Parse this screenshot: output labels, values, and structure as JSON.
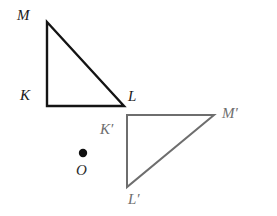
{
  "figure": {
    "background_color": "#ffffff",
    "width": 277,
    "height": 216
  },
  "shapes": {
    "preimage_triangle": {
      "name": "triangle-KML",
      "stroke_color": "#141414",
      "stroke_width": 2.4,
      "fill": "none",
      "points": "47,22 47,106 124,106",
      "vertices": [
        {
          "id": "M",
          "label": "M",
          "x": 47,
          "y": 22
        },
        {
          "id": "K",
          "label": "K",
          "x": 47,
          "y": 106
        },
        {
          "id": "L",
          "label": "L",
          "x": 124,
          "y": 106
        }
      ]
    },
    "image_triangle": {
      "name": "triangle-K-prime-L-prime-M-prime",
      "stroke_color": "#6e6e6e",
      "stroke_width": 2.0,
      "fill": "none",
      "points": "127,115 214,115 127,187",
      "vertices": [
        {
          "id": "Kp",
          "label": "K′",
          "x": 127,
          "y": 115
        },
        {
          "id": "Mp",
          "label": "M′",
          "x": 214,
          "y": 115
        },
        {
          "id": "Lp",
          "label": "L′",
          "x": 127,
          "y": 187
        }
      ]
    },
    "center_point": {
      "name": "point-O",
      "label": "O",
      "x": 83,
      "y": 153,
      "radius": 4.2,
      "color": "#101010"
    }
  },
  "labels": {
    "M": {
      "text": "M",
      "left": 17,
      "top": 8,
      "tone": "dark"
    },
    "K": {
      "text": "K",
      "left": 20,
      "top": 88,
      "tone": "dark"
    },
    "L": {
      "text": "L",
      "left": 128,
      "top": 89,
      "tone": "dark"
    },
    "Kp": {
      "text": "K′",
      "left": 100,
      "top": 122,
      "tone": "gray"
    },
    "Mp": {
      "text": "M′",
      "left": 222,
      "top": 106,
      "tone": "gray"
    },
    "Lp": {
      "text": "L′",
      "left": 128,
      "top": 192,
      "tone": "gray"
    },
    "O": {
      "text": "O",
      "left": 76,
      "top": 163,
      "tone": "center"
    }
  }
}
